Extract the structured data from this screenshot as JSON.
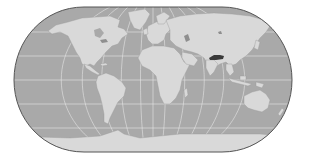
{
  "map": {
    "projection": "eckert-iv-like pseudocylindrical",
    "style": "grayscale",
    "colors": {
      "background": "#ffffff",
      "ocean": "#a9a9a9",
      "land": "#d9d9d9",
      "graticule": "#e6e6e6",
      "outline": "#555555",
      "highlight": "#3a3a3a",
      "lakes": "#8f8f8f"
    },
    "extent": {
      "left_px": 14,
      "right_px": 292,
      "top_px": 7,
      "bottom_px": 152,
      "equator_y_px": 80
    },
    "graticule": {
      "meridian_spacing_deg": 30,
      "parallel_spacing_deg": 30,
      "parallels": [
        "60°N",
        "30°N",
        "0°",
        "30°S",
        "60°S"
      ]
    },
    "highlighted_regions": [
      {
        "name": "Tibet / Xizang",
        "approx_px": {
          "x": 209,
          "y": 55,
          "w": 15,
          "h": 5
        }
      }
    ],
    "continents": [
      "North America",
      "South America",
      "Europe",
      "Africa",
      "Asia",
      "Australia",
      "Antarctica",
      "Greenland"
    ]
  }
}
